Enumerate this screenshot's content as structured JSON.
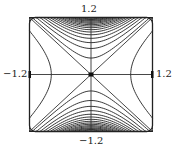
{
  "chart_data": {
    "type": "contour",
    "title": "",
    "function_form": "saddle: y^2 - x^2 (contours densify toward top/bottom edges)",
    "xlim": [
      -1.2,
      1.2
    ],
    "ylim": [
      -1.2,
      1.2
    ],
    "tick_labels": {
      "top": "1.2",
      "bottom": "−1.2",
      "left": "−1.2",
      "right": "1.2"
    },
    "axes_lines": {
      "horizontal_through_origin": true,
      "vertical_through_origin": true
    },
    "asymptotes": [
      "y = x",
      "y = -x"
    ],
    "contour_levels_positive": [
      0.12,
      0.3,
      0.45,
      0.58,
      0.7,
      0.8,
      0.89,
      0.97,
      1.04,
      1.1,
      1.16,
      1.21,
      1.26,
      1.3,
      1.34,
      1.38
    ],
    "contour_levels_negative": [
      -0.6
    ],
    "grid": false,
    "frame": "rounded square",
    "line_color": "#222222"
  }
}
